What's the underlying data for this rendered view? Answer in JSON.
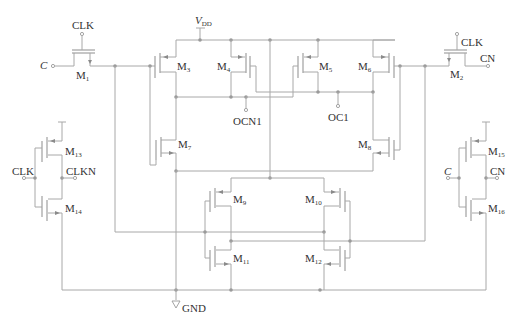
{
  "diagram": {
    "type": "transistor-level circuit schematic",
    "supply": {
      "vdd": "V",
      "vdd_sub": "DD",
      "gnd": "GND"
    },
    "inputs": {
      "c_left": "C",
      "clk_m1": "CLK",
      "clk_m2": "CLK",
      "cn_right": "CN",
      "clk_inv": "CLK",
      "clkn_inv": "CLKN",
      "c_inv": "C",
      "cn_inv": "CN"
    },
    "outputs": {
      "ocn1": "OCN1",
      "oc1": "OC1"
    },
    "transistors": [
      {
        "id": "M1",
        "base": "M",
        "sub": "1"
      },
      {
        "id": "M2",
        "base": "M",
        "sub": "2"
      },
      {
        "id": "M3",
        "base": "M",
        "sub": "3"
      },
      {
        "id": "M4",
        "base": "M",
        "sub": "4"
      },
      {
        "id": "M5",
        "base": "M",
        "sub": "5"
      },
      {
        "id": "M6",
        "base": "M",
        "sub": "6"
      },
      {
        "id": "M7",
        "base": "M",
        "sub": "7"
      },
      {
        "id": "M8",
        "base": "M",
        "sub": "8"
      },
      {
        "id": "M9",
        "base": "M",
        "sub": "9"
      },
      {
        "id": "M10",
        "base": "M",
        "sub": "10"
      },
      {
        "id": "M11",
        "base": "M",
        "sub": "11"
      },
      {
        "id": "M12",
        "base": "M",
        "sub": "12"
      },
      {
        "id": "M13",
        "base": "M",
        "sub": "13"
      },
      {
        "id": "M14",
        "base": "M",
        "sub": "14"
      },
      {
        "id": "M15",
        "base": "M",
        "sub": "15"
      },
      {
        "id": "M16",
        "base": "M",
        "sub": "16"
      }
    ],
    "colors": {
      "wire": "#a8a8a8",
      "node": "#9a9a9a",
      "text": "#333333"
    }
  }
}
